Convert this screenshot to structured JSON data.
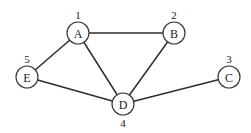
{
  "diagram": {
    "type": "undirected-graph",
    "node_radius": 11,
    "colors": {
      "background": "#ffffff",
      "edge": "#2e2e2e",
      "node_stroke": "#3a3a3a",
      "text": "#222222"
    },
    "nodes": [
      {
        "id": "A",
        "label": "A",
        "number": "1",
        "x": 78,
        "y": 33,
        "number_x": 78,
        "number_y": 15
      },
      {
        "id": "B",
        "label": "B",
        "number": "2",
        "x": 174,
        "y": 33,
        "number_x": 174,
        "number_y": 15
      },
      {
        "id": "C",
        "label": "C",
        "number": "3",
        "x": 229,
        "y": 77,
        "number_x": 229,
        "number_y": 59
      },
      {
        "id": "D",
        "label": "D",
        "number": "4",
        "x": 123,
        "y": 104,
        "number_x": 123,
        "number_y": 123
      },
      {
        "id": "E",
        "label": "E",
        "number": "5",
        "x": 27,
        "y": 77,
        "number_x": 27,
        "number_y": 59
      }
    ],
    "edges": [
      {
        "from": "A",
        "to": "B"
      },
      {
        "from": "A",
        "to": "E"
      },
      {
        "from": "A",
        "to": "D"
      },
      {
        "from": "B",
        "to": "D"
      },
      {
        "from": "E",
        "to": "D"
      },
      {
        "from": "D",
        "to": "C"
      }
    ]
  }
}
